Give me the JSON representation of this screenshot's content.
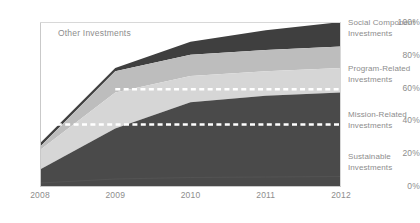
{
  "chart_data": {
    "type": "area",
    "title": "",
    "subtitle": "",
    "xlabel": "",
    "ylabel": "",
    "stacked": true,
    "grid": false,
    "legend_position": "right",
    "categories": [
      "2008",
      "2009",
      "2010",
      "2011",
      "2012"
    ],
    "x": [
      2008,
      2009,
      2010,
      2011,
      2012
    ],
    "ylim": [
      0,
      100
    ],
    "yticks": [
      0,
      20,
      40,
      60,
      80,
      100
    ],
    "ytick_labels": [
      "0%",
      "20%",
      "40%",
      "60%",
      "80%",
      "100%"
    ],
    "xtick_labels": [
      "2008",
      "2009",
      "2010",
      "2011",
      "2012"
    ],
    "series": [
      {
        "name": "Sustainable Investments",
        "color": "#4a4a4a",
        "values": [
          10,
          35,
          51,
          55,
          57
        ]
      },
      {
        "name": "Mission-Related Investments",
        "color": "#d6d6d6",
        "values": [
          12,
          22,
          16,
          15,
          15
        ]
      },
      {
        "name": "Program-Related Investments",
        "color": "#bdbdbd",
        "values": [
          2,
          13,
          13,
          13,
          13
        ]
      },
      {
        "name": "Social Component Investments",
        "color": "#3f3f3f",
        "values": [
          2,
          2,
          8,
          12,
          15
        ]
      },
      {
        "name": "Other Investments",
        "color": "#ffffff",
        "values": [
          74,
          28,
          12,
          5,
          0
        ]
      }
    ],
    "annotations": [
      {
        "name": "other-investments-label",
        "text": "Other Investments",
        "x": 2008.3,
        "y": 93
      },
      {
        "name": "reference-line-upper",
        "text": "",
        "y": 59,
        "style": "dashed-white",
        "x_start": 2009.0,
        "x_end": 2012
      },
      {
        "name": "reference-line-lower",
        "text": "",
        "y": 37.5,
        "style": "dashed-white",
        "x_start": 2008,
        "x_end": 2012
      }
    ]
  },
  "axes": {
    "y_labels": [
      "100%",
      "80%",
      "60%",
      "40%",
      "20%",
      "0%"
    ],
    "x_labels": [
      "2008",
      "2009",
      "2010",
      "2011",
      "2012"
    ]
  },
  "legend": {
    "items": [
      {
        "line1": "Social Component",
        "line2": "Investments"
      },
      {
        "line1": "Program-Related",
        "line2": "Investments"
      },
      {
        "line1": "Mission-Related",
        "line2": "Investments"
      },
      {
        "line1": "Sustainable",
        "line2": "Investments"
      }
    ]
  },
  "plot": {
    "inline_label": "Other Investments"
  }
}
